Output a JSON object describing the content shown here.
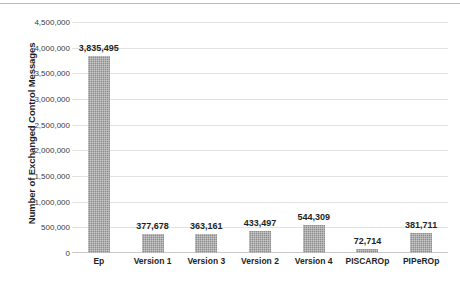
{
  "chart_data": {
    "type": "bar",
    "title": "",
    "subtitle": "",
    "xlabel": "",
    "ylabel": "Number of Exchanged Control Messages",
    "categories": [
      "Ep",
      "Version 1",
      "Version 3",
      "Version 2",
      "Version 4",
      "PISCAROp",
      "PIPeROp"
    ],
    "values": [
      3835495,
      377678,
      363161,
      433497,
      544309,
      72714,
      381711
    ],
    "value_labels": [
      "3,835,495",
      "377,678",
      "363,161",
      "433,497",
      "544,309",
      "72,714",
      "381,711"
    ],
    "ylim": [
      0,
      4500000
    ],
    "ytick_values": [
      0,
      500000,
      1000000,
      1500000,
      2000000,
      2500000,
      3000000,
      3500000,
      4000000,
      4500000
    ],
    "ytick_labels": [
      "0",
      "500,000",
      "1,000,000",
      "1,500,000",
      "2,000,000",
      "2,500,000",
      "3,000,000",
      "3,500,000",
      "4,000,000",
      "4,500,000"
    ],
    "grid": true,
    "grid_axis": "y",
    "legend": false,
    "legend_position": "none",
    "data_labels": true,
    "bar_color": "#8d8d8d",
    "gridline_color": "#e2e2e2",
    "axis_line_color": "#c8c8c8",
    "text_color": "#1f1f1f",
    "background_color": "#ffffff"
  }
}
